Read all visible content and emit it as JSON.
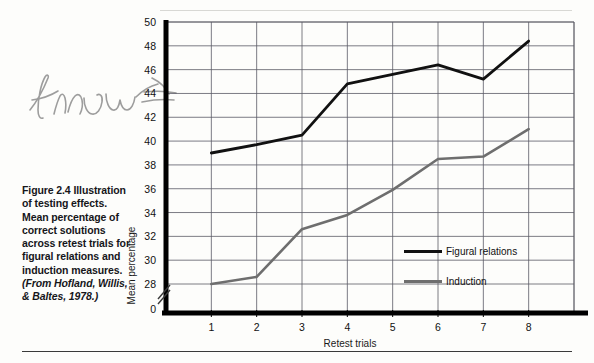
{
  "figure": {
    "caption_lines": [
      "Figure 2.4",
      "Illustration of",
      "testing effects.",
      "Mean percentage",
      "of correct",
      "solutions across",
      "retest trials for",
      "figural relations",
      "and induction",
      "measures."
    ],
    "caption_source": "(From Hofland, Willis, & Baltes, 1978.)"
  },
  "annotation": {
    "handwritten_note": "Know"
  },
  "colors": {
    "figural_relations": "#111111",
    "induction": "#6e6e6e",
    "gridline": "#5a5a66",
    "axis": "#000000",
    "page_background": "#fdfdfb"
  },
  "chart_data": {
    "type": "line",
    "title": "",
    "xlabel": "Retest trials",
    "ylabel": "Mean percentage",
    "x": [
      1,
      2,
      3,
      4,
      5,
      6,
      7,
      8
    ],
    "categories": [
      "1",
      "2",
      "3",
      "4",
      "5",
      "6",
      "7",
      "8"
    ],
    "xlim": [
      0,
      9
    ],
    "ylim": [
      26,
      50
    ],
    "yticks": [
      28,
      30,
      32,
      34,
      36,
      38,
      40,
      42,
      44,
      46,
      48,
      50
    ],
    "ytick_labels": [
      "28",
      "30",
      "32",
      "34",
      "36",
      "38",
      "40",
      "42",
      "44",
      "46",
      "48",
      "50"
    ],
    "y_origin_label": "0",
    "y_axis_broken": true,
    "grid": true,
    "legend_position": "inside-right",
    "series": [
      {
        "name": "Figural relations",
        "color": "#111111",
        "values": [
          39.0,
          39.7,
          40.5,
          44.8,
          45.6,
          46.4,
          45.2,
          48.4
        ]
      },
      {
        "name": "Induction",
        "color": "#6e6e6e",
        "values": [
          28.0,
          28.6,
          32.6,
          33.8,
          35.9,
          38.5,
          38.7,
          41.0
        ]
      }
    ]
  }
}
